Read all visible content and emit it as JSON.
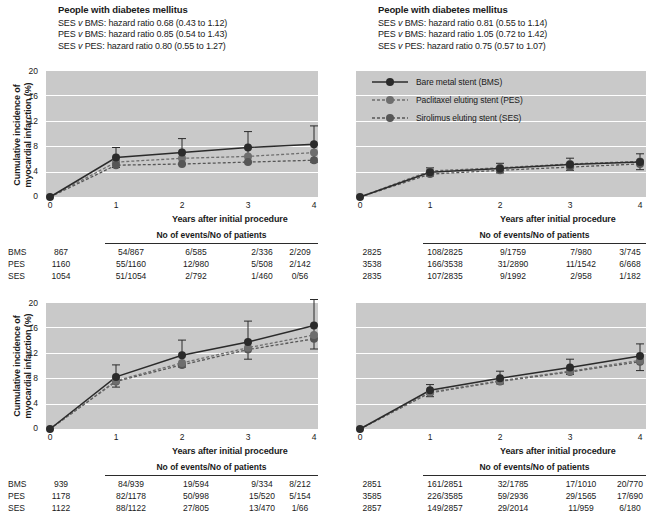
{
  "panels": [
    {
      "id": "top-left",
      "title": "People with diabetes mellitus",
      "hazard_ratios": [
        "SES v BMS: hazard ratio 0.68 (0.43 to 1.12)",
        "PES v BMS: hazard ratio 0.85 (0.54 to 1.43)",
        "SES v PES: hazard ratio 0.80 (0.55 to 1.27)"
      ],
      "ylabel": "Cumulative incidence of myocardial infarction (%)",
      "xlabel": "Years after initial procedure",
      "yticks": [
        "0",
        "4",
        "8",
        "12",
        "16",
        "20"
      ],
      "xticks": [
        "0",
        "1",
        "2",
        "3",
        "4"
      ],
      "table_header": "No of events/No of patients",
      "rows": [
        {
          "label": "BMS",
          "total": "867",
          "cells": [
            "54/867",
            "6/585",
            "2/336",
            "2/209"
          ]
        },
        {
          "label": "PES",
          "total": "1160",
          "cells": [
            "55/1160",
            "12/980",
            "5/508",
            "2/142"
          ]
        },
        {
          "label": "SES",
          "total": "1054",
          "cells": [
            "51/1054",
            "2/792",
            "1/460",
            "0/56"
          ]
        }
      ]
    },
    {
      "id": "top-right",
      "title": "People with diabetes mellitus",
      "hazard_ratios": [
        "SES v BMS: hazard ratio 0.81 (0.55 to 1.14)",
        "PES v BMS: hazard ratio 1.05 (0.72 to 1.42)",
        "SES v PES: hazard ratio 0.75 (0.57 to 1.07)"
      ],
      "ylabel": "",
      "xlabel": "Years after initial procedure",
      "yticks": [],
      "xticks": [
        "0",
        "1",
        "2",
        "3",
        "4"
      ],
      "table_header": "No of events/No of patients",
      "rows": [
        {
          "label": "",
          "total": "2825",
          "cells": [
            "108/2825",
            "9/1759",
            "7/980",
            "3/745"
          ]
        },
        {
          "label": "",
          "total": "3538",
          "cells": [
            "166/3538",
            "31/2890",
            "11/1542",
            "6/668"
          ]
        },
        {
          "label": "",
          "total": "2835",
          "cells": [
            "107/2835",
            "9/1992",
            "2/958",
            "1/182"
          ]
        }
      ]
    },
    {
      "id": "bottom-left",
      "title": "",
      "hazard_ratios": [],
      "ylabel": "Cumulative incidence of myocardial infarction (%)",
      "xlabel": "Years after initial procedure",
      "yticks": [
        "0",
        "4",
        "8",
        "12",
        "16",
        "20"
      ],
      "xticks": [
        "0",
        "1",
        "2",
        "3",
        "4"
      ],
      "table_header": "No of events/No of patients",
      "rows": [
        {
          "label": "BMS",
          "total": "939",
          "cells": [
            "84/939",
            "19/594",
            "9/334",
            "8/212"
          ]
        },
        {
          "label": "PES",
          "total": "1178",
          "cells": [
            "82/1178",
            "50/998",
            "15/520",
            "5/154"
          ]
        },
        {
          "label": "SES",
          "total": "1122",
          "cells": [
            "88/1122",
            "27/805",
            "13/470",
            "1/66"
          ]
        }
      ]
    },
    {
      "id": "bottom-right",
      "title": "",
      "hazard_ratios": [],
      "ylabel": "",
      "xlabel": "Years after initial procedure",
      "yticks": [],
      "xticks": [
        "0",
        "1",
        "2",
        "3",
        "4"
      ],
      "table_header": "No of events/No of patients",
      "rows": [
        {
          "label": "",
          "total": "2851",
          "cells": [
            "161/2851",
            "32/1785",
            "17/1010",
            "20/770"
          ]
        },
        {
          "label": "",
          "total": "3585",
          "cells": [
            "226/3585",
            "59/2936",
            "29/1565",
            "17/690"
          ]
        },
        {
          "label": "",
          "total": "2857",
          "cells": [
            "149/2857",
            "29/2014",
            "11/959",
            "6/180"
          ]
        }
      ]
    }
  ],
  "legend": {
    "items": [
      {
        "label": "Bare metal stent (BMS)",
        "style": "solid",
        "color": "#2b2b2b"
      },
      {
        "label": "Paclitaxel eluting stent (PES)",
        "style": "dashed",
        "color": "#6e6e6e"
      },
      {
        "label": "Sirolimus eluting stent (SES)",
        "style": "dashed",
        "color": "#565656"
      }
    ]
  },
  "chart_data": [
    {
      "type": "line",
      "panel": "top-left",
      "title": "People with diabetes mellitus",
      "xlabel": "Years after initial procedure",
      "ylabel": "Cumulative incidence of myocardial infarction (%)",
      "x": [
        0,
        1,
        2,
        3,
        4
      ],
      "xlim": [
        0,
        4
      ],
      "ylim": [
        0,
        20
      ],
      "grid": true,
      "legend_position": "top-right-panel",
      "series": [
        {
          "name": "Bare metal stent (BMS)",
          "values": [
            0,
            6.2,
            7.0,
            7.8,
            8.3
          ],
          "lo": [
            0,
            4.6,
            5.1,
            5.4,
            5.5
          ],
          "hi": [
            0,
            7.8,
            9.2,
            10.3,
            11.2
          ]
        },
        {
          "name": "Paclitaxel eluting stent (PES)",
          "values": [
            0,
            5.5,
            6.1,
            6.4,
            7.0
          ],
          "lo": [
            0,
            4.1,
            4.5,
            4.6,
            4.8
          ],
          "hi": [
            0,
            7.0,
            8.0,
            8.6,
            9.4
          ]
        },
        {
          "name": "Sirolimus eluting stent (SES)",
          "values": [
            0,
            5.0,
            5.2,
            5.5,
            5.8
          ],
          "lo": [
            0,
            3.6,
            3.8,
            3.8,
            3.9
          ],
          "hi": [
            0,
            6.5,
            6.9,
            7.4,
            7.9
          ]
        }
      ]
    },
    {
      "type": "line",
      "panel": "top-right",
      "title": "People with diabetes mellitus",
      "xlabel": "Years after initial procedure",
      "ylabel": "",
      "x": [
        0,
        1,
        2,
        3,
        4
      ],
      "xlim": [
        0,
        4
      ],
      "ylim": [
        0,
        20
      ],
      "grid": true,
      "series": [
        {
          "name": "Bare metal stent (BMS)",
          "values": [
            0,
            3.9,
            4.5,
            5.1,
            5.5
          ],
          "lo": [
            0,
            3.3,
            3.8,
            4.2,
            4.3
          ],
          "hi": [
            0,
            4.6,
            5.3,
            6.1,
            6.8
          ]
        },
        {
          "name": "Paclitaxel eluting stent (PES)",
          "values": [
            0,
            4.1,
            4.6,
            5.2,
            5.6
          ],
          "lo": [
            0,
            3.5,
            4.0,
            4.4,
            4.5
          ],
          "hi": [
            0,
            4.8,
            5.4,
            6.2,
            6.9
          ]
        },
        {
          "name": "Sirolimus eluting stent (SES)",
          "values": [
            0,
            3.6,
            4.2,
            4.7,
            5.2
          ],
          "lo": [
            0,
            3.0,
            3.5,
            3.9,
            4.1
          ],
          "hi": [
            0,
            4.3,
            5.0,
            5.7,
            6.4
          ]
        }
      ]
    },
    {
      "type": "line",
      "panel": "bottom-left",
      "title": "",
      "xlabel": "Years after initial procedure",
      "ylabel": "Cumulative incidence of myocardial infarction (%)",
      "x": [
        0,
        1,
        2,
        3,
        4
      ],
      "xlim": [
        0,
        4
      ],
      "ylim": [
        0,
        20
      ],
      "grid": true,
      "series": [
        {
          "name": "Bare metal stent (BMS)",
          "values": [
            0,
            8.2,
            11.6,
            13.7,
            16.3
          ],
          "lo": [
            0,
            6.6,
            9.6,
            11.0,
            12.6
          ],
          "hi": [
            0,
            10.1,
            14.0,
            17.0,
            20.4
          ]
        },
        {
          "name": "Paclitaxel eluting stent (PES)",
          "values": [
            0,
            7.6,
            10.4,
            12.8,
            14.8
          ],
          "lo": [
            0,
            6.2,
            8.7,
            10.3,
            11.5
          ],
          "hi": [
            0,
            9.3,
            12.4,
            15.6,
            18.6
          ]
        },
        {
          "name": "Sirolimus eluting stent (SES)",
          "values": [
            0,
            7.5,
            10.1,
            12.5,
            14.2
          ],
          "lo": [
            0,
            6.1,
            8.4,
            10.0,
            11.0
          ],
          "hi": [
            0,
            9.2,
            12.0,
            15.2,
            18.0
          ]
        }
      ]
    },
    {
      "type": "line",
      "panel": "bottom-right",
      "title": "",
      "xlabel": "Years after initial procedure",
      "ylabel": "",
      "x": [
        0,
        1,
        2,
        3,
        4
      ],
      "xlim": [
        0,
        4
      ],
      "ylim": [
        0,
        20
      ],
      "grid": true,
      "series": [
        {
          "name": "Bare metal stent (BMS)",
          "values": [
            0,
            6.1,
            8.0,
            9.7,
            11.5
          ],
          "lo": [
            0,
            5.4,
            7.1,
            8.6,
            9.8
          ],
          "hi": [
            0,
            7.0,
            9.1,
            11.0,
            13.4
          ]
        },
        {
          "name": "Paclitaxel eluting stent (PES)",
          "values": [
            0,
            5.8,
            7.6,
            9.1,
            10.8
          ],
          "lo": [
            0,
            5.1,
            6.8,
            8.0,
            9.1
          ],
          "hi": [
            0,
            6.6,
            8.6,
            10.3,
            12.6
          ]
        },
        {
          "name": "Sirolimus eluting stent (SES)",
          "values": [
            0,
            5.7,
            7.5,
            9.0,
            10.6
          ],
          "lo": [
            0,
            5.0,
            6.6,
            7.9,
            8.9
          ],
          "hi": [
            0,
            6.5,
            8.4,
            10.2,
            12.4
          ]
        }
      ]
    }
  ]
}
